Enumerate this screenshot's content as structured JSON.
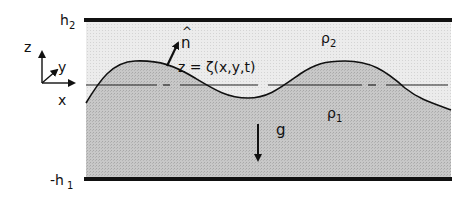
{
  "diagram": {
    "type": "two-layer fluid schematic",
    "labels": {
      "top_boundary": "h",
      "top_boundary_sub": "2",
      "bottom_boundary": "-h",
      "bottom_boundary_sub": "1",
      "upper_density": "ρ",
      "upper_density_sub": "2",
      "lower_density": "ρ",
      "lower_density_sub": "1",
      "interface_eq": "z = ζ(x,y,t)",
      "normal_vector": "n",
      "normal_hat": "^",
      "gravity": "g",
      "axis_z": "z",
      "axis_y": "y",
      "axis_x": "x"
    },
    "colors": {
      "upper_fluid": "#e6e6e6",
      "lower_fluid": "#c4c4c4",
      "lines": "#111111",
      "background": "#ffffff"
    }
  }
}
